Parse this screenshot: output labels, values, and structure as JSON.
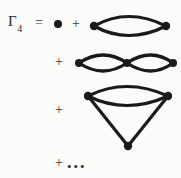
{
  "equation": {
    "lhs_symbol": "Γ",
    "lhs_subscript": "4",
    "equals_sign": "=",
    "plus_sign": "+",
    "ellipsis": "•••"
  },
  "terms": [
    {
      "index": 0,
      "name": "point-vertex-term",
      "icon": "filled-dot",
      "description": "bare four-point vertex (single dot)",
      "vertices": 1
    },
    {
      "index": 1,
      "name": "single-bubble-term",
      "icon": "lens-bubble-diagram",
      "description": "one-loop bubble: two propagator arcs joining two vertices",
      "vertices": 2,
      "loops": 1
    },
    {
      "index": 2,
      "name": "double-bubble-term",
      "icon": "double-lens-bubble-diagram",
      "description": "two-loop chain: two bubbles sharing a middle vertex",
      "vertices": 3,
      "loops": 2
    },
    {
      "index": 3,
      "name": "cone-triangle-term",
      "icon": "cone-triangle-diagram",
      "description": "bubble on top with two straight legs meeting at a lower vertex",
      "vertices": 3,
      "loops": 2
    },
    {
      "index": 4,
      "name": "ellipsis-term",
      "icon": "ellipsis-dots",
      "description": "higher order terms continue"
    }
  ],
  "style": {
    "ink_color": "#1a1a1a",
    "background_color": "#fbfbfa",
    "line_weight": "3px"
  }
}
